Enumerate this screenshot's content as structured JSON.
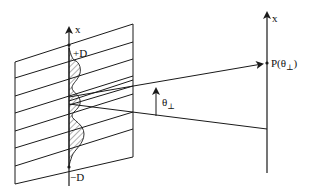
{
  "diagram": {
    "colors": {
      "stroke": "#1a1a1a",
      "background": "#ffffff"
    },
    "labels": {
      "slit_axis": "x",
      "screen_axis": "x",
      "plus_d": "+D",
      "minus_d": "−D",
      "point": "P(θ",
      "point_sub": "⊥",
      "point_close": ")",
      "angle": "θ",
      "angle_sub": "⊥"
    },
    "elements": [
      "aperture-plane (parallelogram with 8 slanted lines)",
      "slit x-axis with +D and −D markers",
      "hatched intensity profile along slit axis",
      "rays converging to P(θ⊥)",
      "screen x-axis",
      "angle arrow θ⊥"
    ]
  }
}
